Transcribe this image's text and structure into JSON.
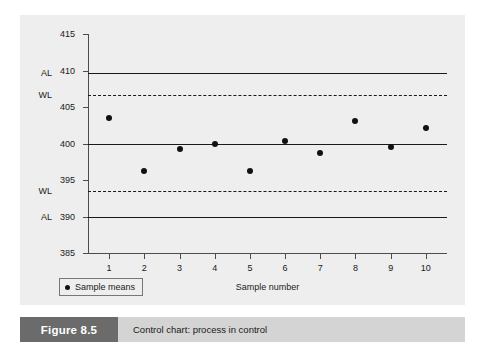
{
  "figure": {
    "tag": "Figure 8.5",
    "caption": "Control chart: process in control",
    "tag_bg": "#6b6b6b",
    "caption_bg": "#d4d4d4",
    "panel_bg": "#eeeeee"
  },
  "chart_data": {
    "type": "scatter",
    "title": "",
    "subtitle": "",
    "xlabel": "Sample number",
    "ylabel": "",
    "x": [
      1,
      2,
      3,
      4,
      5,
      6,
      7,
      8,
      9,
      10
    ],
    "categories": [
      "1",
      "2",
      "3",
      "4",
      "5",
      "6",
      "7",
      "8",
      "9",
      "10"
    ],
    "series": [
      {
        "name": "Sample means",
        "values": [
          403.5,
          396.2,
          399.2,
          400.0,
          396.2,
          400.3,
          398.7,
          403.1,
          399.5,
          402.1
        ]
      }
    ],
    "ylim": [
      385,
      415
    ],
    "xlim": [
      0.4,
      10.6
    ],
    "yticks": [
      415,
      410,
      405,
      400,
      395,
      390,
      385
    ],
    "ytick_labels": [
      "415",
      "410",
      "405",
      "400",
      "395",
      "390",
      "385"
    ],
    "xticks": [
      1,
      2,
      3,
      4,
      5,
      6,
      7,
      8,
      9,
      10
    ],
    "grid": false,
    "legend": {
      "position": "below-left",
      "entries": [
        {
          "label": "Sample means",
          "marker": "filled-circle",
          "color": "#111111"
        }
      ]
    },
    "reference_lines": [
      {
        "label": "AL",
        "kind": "upper-action-limit",
        "value": 409.6,
        "style": "solid",
        "color": "#1a1a1a"
      },
      {
        "label": "WL",
        "kind": "upper-warning-limit",
        "value": 406.6,
        "style": "dashed",
        "color": "#1a1a1a"
      },
      {
        "label": "",
        "kind": "centre-line",
        "value": 400.0,
        "style": "solid",
        "color": "#1a1a1a"
      },
      {
        "label": "WL",
        "kind": "lower-warning-limit",
        "value": 393.5,
        "style": "dashed",
        "color": "#1a1a1a"
      },
      {
        "label": "AL",
        "kind": "lower-action-limit",
        "value": 390.0,
        "style": "solid",
        "color": "#1a1a1a"
      }
    ],
    "limit_labels": [
      {
        "text": "AL",
        "value": 409.6
      },
      {
        "text": "WL",
        "value": 406.6
      },
      {
        "text": "WL",
        "value": 393.5
      },
      {
        "text": "AL",
        "value": 390.0
      }
    ]
  }
}
